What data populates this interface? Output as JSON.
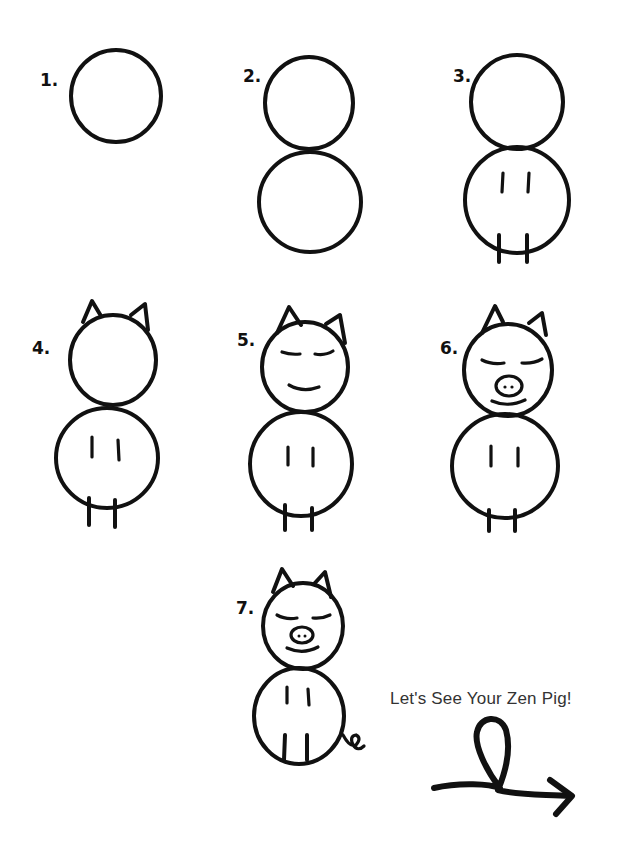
{
  "steps": [
    {
      "label": "1."
    },
    {
      "label": "2."
    },
    {
      "label": "3."
    },
    {
      "label": "4."
    },
    {
      "label": "5."
    },
    {
      "label": "6."
    },
    {
      "label": "7."
    }
  ],
  "caption": "Let's See Your Zen Pig!",
  "icons": {
    "arrow": "loop-arrow-icon"
  },
  "colors": {
    "ink": "#111111",
    "background": "#ffffff",
    "caption": "#333333"
  }
}
